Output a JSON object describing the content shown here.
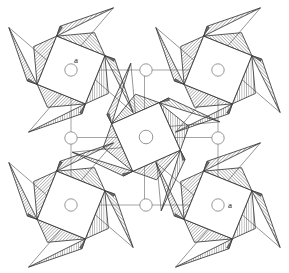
{
  "figure": {
    "title": "",
    "background_color": "#ffffff",
    "width": 289,
    "height": 273
  },
  "style": {
    "outline_color": "#3a3a3a",
    "hatch_color": "#5a5a5a",
    "cell_line_color": "#9a9a9a",
    "circle_stroke": "#8a8a8a",
    "dark_edge_color": "#2b2b2b",
    "shadow_fill": "#6e6e6e",
    "label_color": "#1a1a1a"
  },
  "labels": [
    {
      "id": "a-top-left",
      "text": "a",
      "x": 74,
      "y": 63
    },
    {
      "id": "a-bottom-right",
      "text": "a",
      "x": 228,
      "y": 208
    }
  ],
  "unit_cell": {
    "name": "unit-cell-outline",
    "x0": 71,
    "y0": 70,
    "x1": 218,
    "y1": 205,
    "stroke_width": 0.9
  },
  "atom_circles": [
    {
      "id": "corner-top-left",
      "cx": 71,
      "cy": 70,
      "r": 6.2
    },
    {
      "id": "edge-top-mid",
      "cx": 146,
      "cy": 70,
      "r": 6.2
    },
    {
      "id": "corner-top-right",
      "cx": 218,
      "cy": 70,
      "r": 6.2
    },
    {
      "id": "edge-left-mid",
      "cx": 71,
      "cy": 138,
      "r": 6.2
    },
    {
      "id": "center",
      "cx": 146,
      "cy": 137,
      "r": 6.8
    },
    {
      "id": "edge-right-mid",
      "cx": 218,
      "cy": 138,
      "r": 6.2
    },
    {
      "id": "corner-bottom-left",
      "cx": 71,
      "cy": 205,
      "r": 6.2
    },
    {
      "id": "edge-bottom-mid",
      "cx": 146,
      "cy": 205,
      "r": 6.2
    },
    {
      "id": "corner-bottom-right",
      "cx": 218,
      "cy": 205,
      "r": 6.2
    }
  ],
  "pinwheels": [
    {
      "id": "pinwheel-top-left",
      "cx": 71,
      "cy": 70,
      "rotation": 22,
      "scale": 1.0
    },
    {
      "id": "pinwheel-top-right",
      "cx": 218,
      "cy": 70,
      "rotation": 22,
      "scale": 1.0
    },
    {
      "id": "pinwheel-center",
      "cx": 146,
      "cy": 137,
      "rotation": -24,
      "scale": 1.0
    },
    {
      "id": "pinwheel-bottom-left",
      "cx": 71,
      "cy": 205,
      "rotation": 22,
      "scale": 1.0
    },
    {
      "id": "pinwheel-bottom-right",
      "cx": 218,
      "cy": 205,
      "rotation": 22,
      "scale": 1.0
    }
  ],
  "geometry_notes": {
    "square_half": 26,
    "blade_length": 58,
    "blade_half_width": 26,
    "hatch_spacing_px": 2.2
  }
}
